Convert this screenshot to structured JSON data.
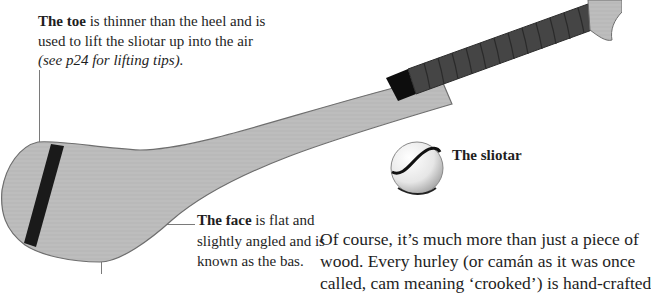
{
  "toe_caption": {
    "bold": "The toe",
    "text": " is thinner than the heel and is used to lift the sliotar up into the air ",
    "italic": "(see p24 for lifting tips)."
  },
  "face_caption": {
    "bold": "The face",
    "text": " is flat and slightly angled and is known as the bas."
  },
  "sliotar_label": "The sliotar",
  "body_paragraph": {
    "lines": [
      "Of course, it’s much more than just a piece of",
      "wood. Every hurley (or camán as it was once",
      "called, cam meaning ‘crooked’) is hand-crafted"
    ]
  },
  "illustration": {
    "hurley_wood_color": "#bdbdbd",
    "hurley_outline_color": "#6e6e6e",
    "band_color": "#111111",
    "grip_color": "#454545",
    "grip_segment_count": 12,
    "leader_line_color": "#7a7a7a"
  }
}
